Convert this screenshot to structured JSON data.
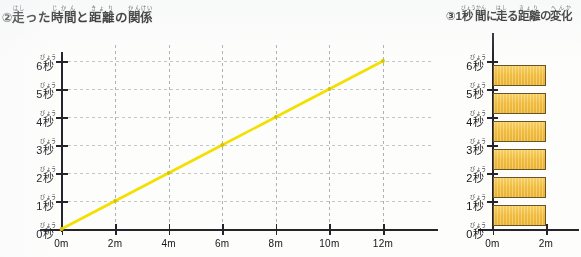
{
  "left_chart": {
    "title_plain": "②走った時間と距離の関係",
    "title_parts": [
      {
        "text": "②",
        "ruby": ""
      },
      {
        "text": "走",
        "ruby": "はし"
      },
      {
        "text": "った",
        "ruby": ""
      },
      {
        "text": "時間",
        "ruby": "じかん"
      },
      {
        "text": "と",
        "ruby": ""
      },
      {
        "text": "距離",
        "ruby": "きょり"
      },
      {
        "text": "の",
        "ruby": ""
      },
      {
        "text": "関係",
        "ruby": "かんけい"
      }
    ],
    "y_labels": [
      "0秒",
      "1秒",
      "2秒",
      "3秒",
      "4秒",
      "5秒",
      "6秒"
    ],
    "y_label_ruby": "びょう",
    "y_label_number": [
      "0",
      "1",
      "2",
      "3",
      "4",
      "5",
      "6"
    ],
    "y_label_unit": "秒",
    "x_labels": [
      "0m",
      "2m",
      "4m",
      "6m",
      "8m",
      "10m",
      "12m"
    ]
  },
  "right_chart": {
    "title_plain": "③1秒間に走る距離の変化",
    "title_parts": [
      {
        "text": "③",
        "ruby": ""
      },
      {
        "text": "1",
        "ruby": ""
      },
      {
        "text": "秒間",
        "ruby": "びょうかん"
      },
      {
        "text": "に",
        "ruby": ""
      },
      {
        "text": "走",
        "ruby": "はし"
      },
      {
        "text": "る",
        "ruby": ""
      },
      {
        "text": "距離",
        "ruby": "きょり"
      },
      {
        "text": "の",
        "ruby": ""
      },
      {
        "text": "変化",
        "ruby": "へんか"
      }
    ],
    "y_labels": [
      "0秒",
      "1秒",
      "2秒",
      "3秒",
      "4秒",
      "5秒",
      "6秒"
    ],
    "y_label_ruby": "びょう",
    "y_label_number": [
      "0",
      "1",
      "2",
      "3",
      "4",
      "5",
      "6"
    ],
    "y_label_unit": "秒",
    "x_labels": [
      "0m",
      "2m"
    ]
  },
  "colors": {
    "line": "#f2e000",
    "line_point": "#d8c400",
    "bar_fill": "#efbc3f",
    "bar_stroke": "#6a5426",
    "axis": "#24242a",
    "grid": "#9fa3ad"
  },
  "chart_data": [
    {
      "type": "line",
      "title": "②走った時間と距離の関係",
      "xlabel": "",
      "ylabel": "",
      "xlim": [
        0,
        12
      ],
      "ylim": [
        0,
        6
      ],
      "x_unit": "m",
      "y_unit": "秒",
      "grid": true,
      "legend": "none",
      "x_ticks": [
        0,
        2,
        4,
        6,
        8,
        10,
        12
      ],
      "y_ticks": [
        0,
        1,
        2,
        3,
        4,
        5,
        6
      ],
      "x_tick_labels": [
        "0m",
        "2m",
        "4m",
        "6m",
        "8m",
        "10m",
        "12m"
      ],
      "y_tick_labels": [
        "0秒",
        "1秒",
        "2秒",
        "3秒",
        "4秒",
        "5秒",
        "6秒"
      ],
      "series": [
        {
          "name": "走った時間と距離",
          "color": "#f2e000",
          "x": [
            0,
            2,
            4,
            6,
            8,
            10,
            12
          ],
          "y": [
            0,
            1,
            2,
            3,
            4,
            5,
            6
          ]
        }
      ]
    },
    {
      "type": "bar",
      "orientation": "horizontal",
      "title": "③1秒間に走る距離の変化",
      "xlabel": "",
      "ylabel": "",
      "xlim": [
        0,
        2.6
      ],
      "x_unit": "m",
      "grid": false,
      "legend": "none",
      "x_ticks": [
        0,
        2
      ],
      "x_tick_labels": [
        "0m",
        "2m"
      ],
      "categories": [
        "0秒",
        "1秒",
        "2秒",
        "3秒",
        "4秒",
        "5秒",
        "6秒"
      ],
      "bar_bands": [
        "0秒〜1秒",
        "1秒〜2秒",
        "2秒〜3秒",
        "3秒〜4秒",
        "4秒〜5秒",
        "5秒〜6秒"
      ],
      "values": [
        2,
        2,
        2,
        2,
        2,
        2
      ],
      "bar_color": "#efbc3f"
    }
  ]
}
